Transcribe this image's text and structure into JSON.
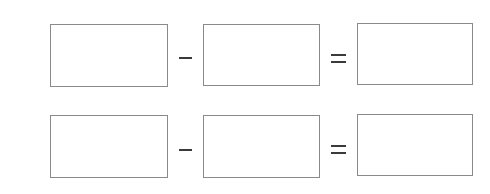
{
  "worksheet": {
    "rows": [
      {
        "operator": "−",
        "relation": "=",
        "boxes": [
          {
            "value": ""
          },
          {
            "value": ""
          },
          {
            "value": ""
          }
        ]
      },
      {
        "operator": "−",
        "relation": "=",
        "boxes": [
          {
            "value": ""
          },
          {
            "value": ""
          },
          {
            "value": ""
          }
        ]
      }
    ],
    "colors": {
      "box_border": "#8a8a8a",
      "symbol": "#3a3a3a",
      "background": "#ffffff"
    }
  }
}
